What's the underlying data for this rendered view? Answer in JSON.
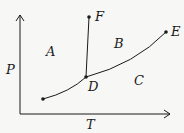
{
  "diagram": {
    "type": "phase-diagram",
    "axes": {
      "y_label": "P",
      "x_label": "T"
    },
    "regions": {
      "A": "A",
      "B": "B",
      "C": "C"
    },
    "points": {
      "D": "D",
      "E": "E",
      "F": "F"
    },
    "colors": {
      "line": "#1a1a1a",
      "background": "#f7f7f5"
    }
  }
}
